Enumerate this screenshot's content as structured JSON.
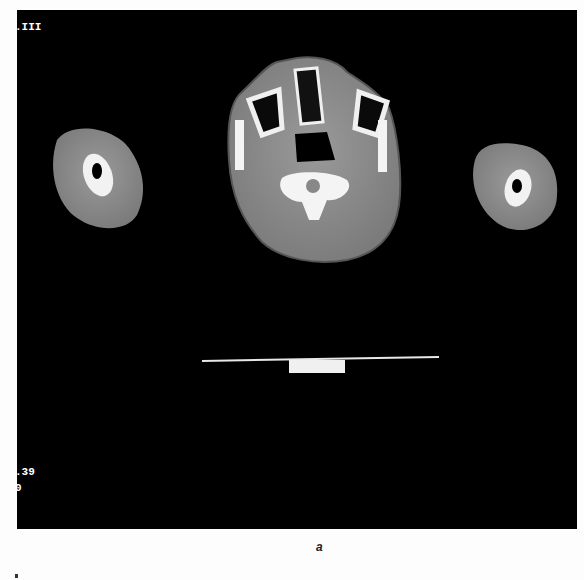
{
  "image": {
    "description": "Axial CT slice of head/neck at level of maxillary sinuses and upper cervical spine with both arms in cross-section, patient table visible below",
    "overlays": {
      "top_left": ".III",
      "bottom_left_line1": ".39",
      "bottom_left_line2": "0"
    },
    "caption": "a"
  },
  "colors": {
    "background": "#000000",
    "soft_tissue": "#8a8a8a",
    "bone": "#f4f4f4",
    "page": "#fdfdfd"
  }
}
